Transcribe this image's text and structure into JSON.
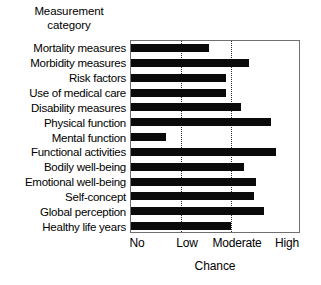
{
  "chart_data": {
    "type": "bar",
    "orientation": "horizontal",
    "title": "",
    "ylabel_title_line1": "Measurement",
    "ylabel_title_line2": "category",
    "xlabel": "Chance",
    "ylabel": "Measurement category",
    "grid": true,
    "grid_axis": "x",
    "legend": null,
    "xlim": [
      0,
      3.4
    ],
    "xticks": [
      0,
      1,
      2,
      3
    ],
    "xticklabels": [
      "No",
      "Low",
      "Moderate",
      "High"
    ],
    "bar_color": "#0a0a0a",
    "frame_color": "#6f6f6f",
    "background": "#ffffff",
    "categories": [
      "Mortality measures",
      "Morbidity measures",
      "Risk factors",
      "Use of medical care",
      "Disability measures",
      "Physical function",
      "Mental function",
      "Functional activities",
      "Bodily well-being",
      "Emotional well-being",
      "Self-concept",
      "Global perception",
      "Healthy life years"
    ],
    "values": [
      1.55,
      2.35,
      1.9,
      1.9,
      2.2,
      2.8,
      0.7,
      2.9,
      2.25,
      2.5,
      2.45,
      2.65,
      2.0
    ]
  },
  "axis_titles": {
    "y_line1": "Measurement",
    "y_line2": "category",
    "x": "Chance"
  }
}
